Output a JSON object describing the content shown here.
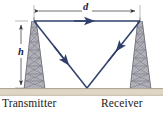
{
  "figure": {
    "background_color": "#ffffff",
    "ground_color": "#ded7c6",
    "ground_line_color": "#b8b09c",
    "ray_color": "#2e3f6b",
    "tower_color": "#8d8d96",
    "dimension_color": "#7a7a7a",
    "label_color": "#1a1a1a"
  },
  "labels": {
    "transmitter": "Transmitter",
    "receiver": "Receiver",
    "distance": "d",
    "height": "h"
  },
  "dimensions": {
    "distance_label": "d",
    "distance_description": "horizontal separation between tower tops",
    "height_label": "h",
    "height_description": "tower height above ground"
  },
  "elements": {
    "left_tower_name": "transmitter-tower",
    "right_tower_name": "receiver-tower",
    "direct_path_name": "direct-signal-path",
    "reflected_path_name": "ground-reflected-signal-path",
    "ground_name": "ground-surface"
  },
  "geometry": {
    "tower_top_y": 21,
    "ground_y": 88,
    "left_tower_top_x": 34,
    "right_tower_top_x": 140,
    "reflection_point_x": 87,
    "reflection_point_y": 88,
    "dimension_line_d_y": 11,
    "dimension_line_h_x": 21
  },
  "arrows": {
    "direct_path_direction": "right",
    "incident_ray_direction": "down-right",
    "reflected_ray_direction": "up-right",
    "d_arrow_left_direction": "left",
    "d_arrow_right_direction": "right",
    "h_arrow_top_direction": "up",
    "h_arrow_bottom_direction": "down"
  }
}
